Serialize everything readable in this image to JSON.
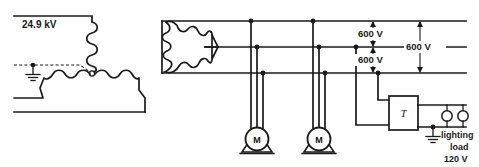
{
  "diagram": {
    "primary": {
      "voltage_label": "24.9 kV",
      "winding_type": "wye",
      "grounded": true,
      "ground_icon": "ground-icon"
    },
    "secondary": {
      "winding_type": "delta",
      "bus_count": 3
    },
    "dimensions": [
      {
        "id": "upper",
        "label": "600 V"
      },
      {
        "id": "lower",
        "label": "600 V"
      },
      {
        "id": "overall",
        "label": "600 V"
      }
    ],
    "motors": [
      {
        "id": "motor-1",
        "label": "M",
        "phases": 3
      },
      {
        "id": "motor-2",
        "label": "M",
        "phases": 3
      }
    ],
    "transformer": {
      "label": "T",
      "icon": "transformer-box-icon",
      "grounded": true
    },
    "load": {
      "line1": "lighting",
      "line2": "load",
      "line3": "120 V",
      "lamp_count": 2,
      "lamp_icon": "lamp-icon"
    },
    "colors": {
      "line": "#1a1a1a",
      "background": "#ffffff",
      "fill": "#ffffff"
    }
  }
}
